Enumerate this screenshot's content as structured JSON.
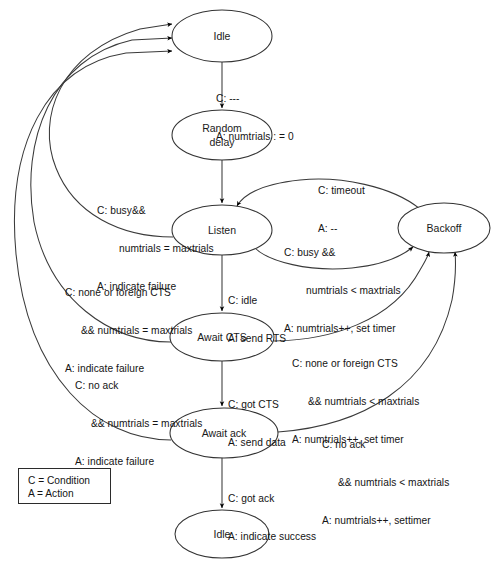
{
  "diagram": {
    "type": "state-machine",
    "canvas": {
      "width": 499,
      "height": 569
    },
    "colors": {
      "background": "#ffffff",
      "node_stroke": "#333333",
      "edge_stroke": "#3a3a3a",
      "text": "#141414"
    },
    "states": [
      {
        "id": "idle_top",
        "label": "Idle",
        "cx": 222,
        "cy": 36,
        "rx": 50,
        "ry": 26
      },
      {
        "id": "random",
        "label": "Random\ndelay",
        "line1": "Random",
        "line2": "delay",
        "cx": 222,
        "cy": 135,
        "rx": 50,
        "ry": 25
      },
      {
        "id": "listen",
        "label": "Listen",
        "cx": 222,
        "cy": 230,
        "rx": 50,
        "ry": 25
      },
      {
        "id": "backoff",
        "label": "Backoff",
        "cx": 444,
        "cy": 228,
        "rx": 46,
        "ry": 25
      },
      {
        "id": "await_cts",
        "label": "Await CTS",
        "cx": 222,
        "cy": 337,
        "rx": 52,
        "ry": 24
      },
      {
        "id": "await_ack",
        "label": "Await ack",
        "cx": 224,
        "cy": 433,
        "rx": 54,
        "ry": 25
      },
      {
        "id": "idle_bot",
        "label": "Idle",
        "cx": 222,
        "cy": 534,
        "rx": 47,
        "ry": 24
      }
    ],
    "transitions": [
      {
        "id": "idle-to-random",
        "from": "idle_top",
        "to": "random",
        "condition": "C: ---",
        "action": "A: numtrials : = 0",
        "label_x": 228,
        "label_y": 74
      },
      {
        "id": "listen-to-idle",
        "from": "listen",
        "to": "idle_top",
        "condition": "C: busy&&",
        "condition2": "numtrials = maxtrials",
        "action": "A: indicate failure",
        "label_x": 100,
        "label_y": 185
      },
      {
        "id": "backoff-to-listen",
        "from": "backoff",
        "to": "listen",
        "condition": "C: timeout",
        "action": "A: --",
        "label_x": 322,
        "label_y": 165
      },
      {
        "id": "listen-to-backoff",
        "from": "listen",
        "to": "backoff",
        "condition": "C: busy &&",
        "condition2": "numtrials < maxtrials",
        "action": "A: numtrials++, set timer",
        "label_x": 284,
        "label_y": 225
      },
      {
        "id": "listen-to-awaitcts",
        "from": "listen",
        "to": "await_cts",
        "condition": "C: idle",
        "action": "A: send RTS",
        "label_x": 230,
        "label_y": 276
      },
      {
        "id": "awaitcts-to-idle",
        "from": "await_cts",
        "to": "idle_top",
        "condition": "C: none or foreign CTS",
        "condition2": "&& numtrials = maxtrials",
        "action": "A: indicate failure",
        "label_x": 68,
        "label_y": 267
      },
      {
        "id": "awaitcts-to-backoff",
        "from": "await_cts",
        "to": "backoff",
        "condition": "C: none or foreign CTS",
        "condition2": "&& numtrials < maxtrials",
        "action": "A: numtrials++, set timer",
        "label_x": 292,
        "label_y": 337
      },
      {
        "id": "awaitack-to-idle",
        "from": "await_ack",
        "to": "idle_top",
        "condition": "C: no ack",
        "condition2": "&& numtrials = maxtrials",
        "action": "A: indicate failure",
        "label_x": 78,
        "label_y": 360
      },
      {
        "id": "awaitcts-to-awaitack",
        "from": "await_cts",
        "to": "await_ack",
        "condition": "C: got CTS",
        "action": "A: send data",
        "label_x": 228,
        "label_y": 380
      },
      {
        "id": "awaitack-to-backoff",
        "from": "await_ack",
        "to": "backoff",
        "condition": "C: no ack",
        "condition2": "&& numtrials < maxtrials",
        "action": "A: numtrials++, settimer",
        "label_x": 322,
        "label_y": 418
      },
      {
        "id": "awaitack-to-idle-bottom",
        "from": "await_ack",
        "to": "idle_bot",
        "condition": "C: got ack",
        "action": "A: indicate success",
        "label_x": 228,
        "label_y": 473
      }
    ],
    "legend": {
      "x": 18,
      "y": 468,
      "width": 93,
      "height": 36,
      "lines": [
        "C = Condition",
        "A = Action"
      ]
    }
  }
}
